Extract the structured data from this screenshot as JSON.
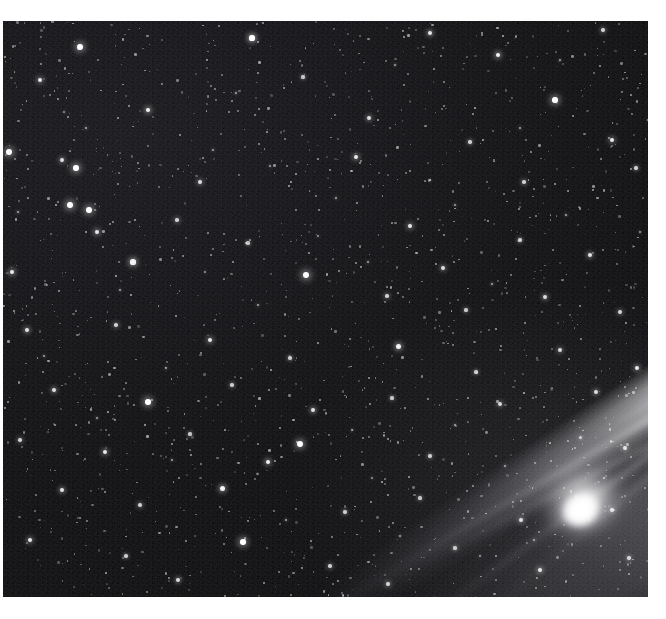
{
  "image": {
    "subject": "comet",
    "title": "Comet with long dust tail over dense star field",
    "medium": "black-and-white astrophotograph",
    "orientation": "landscape",
    "background_color": "#050506",
    "border_color": "#ffffff",
    "star_color": "#ffffff",
    "tail_color": "#b4b4b8",
    "coma_color": "#ffffff"
  },
  "plate": {
    "left": 3,
    "top": 21,
    "width": 645,
    "height": 576
  },
  "comet": {
    "nucleus_x": 578,
    "nucleus_y": 492,
    "coma_width": 88,
    "coma_height": 72,
    "tail_angle_deg": -33,
    "tail_length": 600,
    "tail_direction": "upper-left",
    "filament_count": 4
  },
  "stars": [
    {
      "x": 252,
      "y": 38,
      "r": 2.6,
      "b": 1.0
    },
    {
      "x": 80,
      "y": 47,
      "r": 2.9,
      "b": 1.0
    },
    {
      "x": 430,
      "y": 33,
      "r": 2.1,
      "b": 0.9
    },
    {
      "x": 498,
      "y": 55,
      "r": 2.4,
      "b": 0.95
    },
    {
      "x": 603,
      "y": 30,
      "r": 1.8,
      "b": 0.8
    },
    {
      "x": 555,
      "y": 100,
      "r": 2.7,
      "b": 1.0
    },
    {
      "x": 40,
      "y": 80,
      "r": 2.2,
      "b": 0.9
    },
    {
      "x": 148,
      "y": 110,
      "r": 2.4,
      "b": 0.95
    },
    {
      "x": 303,
      "y": 77,
      "r": 1.6,
      "b": 0.75
    },
    {
      "x": 369,
      "y": 118,
      "r": 2.0,
      "b": 0.85
    },
    {
      "x": 470,
      "y": 142,
      "r": 1.7,
      "b": 0.8
    },
    {
      "x": 612,
      "y": 140,
      "r": 2.2,
      "b": 0.9
    },
    {
      "x": 9,
      "y": 152,
      "r": 3.0,
      "b": 1.0
    },
    {
      "x": 62,
      "y": 160,
      "r": 2.0,
      "b": 0.85
    },
    {
      "x": 76,
      "y": 168,
      "r": 2.8,
      "b": 1.0
    },
    {
      "x": 200,
      "y": 182,
      "r": 1.9,
      "b": 0.85
    },
    {
      "x": 356,
      "y": 157,
      "r": 2.3,
      "b": 0.9
    },
    {
      "x": 524,
      "y": 182,
      "r": 1.8,
      "b": 0.8
    },
    {
      "x": 636,
      "y": 168,
      "r": 1.7,
      "b": 0.8
    },
    {
      "x": 70,
      "y": 205,
      "r": 3.1,
      "b": 1.0
    },
    {
      "x": 89,
      "y": 210,
      "r": 2.9,
      "b": 1.0
    },
    {
      "x": 97,
      "y": 232,
      "r": 2.4,
      "b": 0.9
    },
    {
      "x": 177,
      "y": 220,
      "r": 1.8,
      "b": 0.8
    },
    {
      "x": 248,
      "y": 243,
      "r": 1.6,
      "b": 0.75
    },
    {
      "x": 410,
      "y": 226,
      "r": 2.2,
      "b": 0.9
    },
    {
      "x": 443,
      "y": 268,
      "r": 1.9,
      "b": 0.85
    },
    {
      "x": 520,
      "y": 240,
      "r": 1.7,
      "b": 0.8
    },
    {
      "x": 590,
      "y": 255,
      "r": 2.1,
      "b": 0.88
    },
    {
      "x": 12,
      "y": 272,
      "r": 2.4,
      "b": 0.92
    },
    {
      "x": 133,
      "y": 262,
      "r": 2.6,
      "b": 0.95
    },
    {
      "x": 306,
      "y": 275,
      "r": 3.2,
      "b": 1.0
    },
    {
      "x": 387,
      "y": 296,
      "r": 1.8,
      "b": 0.8
    },
    {
      "x": 466,
      "y": 310,
      "r": 1.6,
      "b": 0.75
    },
    {
      "x": 545,
      "y": 297,
      "r": 2.0,
      "b": 0.85
    },
    {
      "x": 620,
      "y": 312,
      "r": 1.9,
      "b": 0.82
    },
    {
      "x": 27,
      "y": 330,
      "r": 2.1,
      "b": 0.88
    },
    {
      "x": 116,
      "y": 325,
      "r": 1.8,
      "b": 0.8
    },
    {
      "x": 210,
      "y": 340,
      "r": 2.3,
      "b": 0.9
    },
    {
      "x": 290,
      "y": 358,
      "r": 1.7,
      "b": 0.78
    },
    {
      "x": 398,
      "y": 346,
      "r": 2.5,
      "b": 0.95
    },
    {
      "x": 476,
      "y": 372,
      "r": 1.6,
      "b": 0.75
    },
    {
      "x": 560,
      "y": 350,
      "r": 1.9,
      "b": 0.83
    },
    {
      "x": 637,
      "y": 368,
      "r": 2.2,
      "b": 0.9
    },
    {
      "x": 54,
      "y": 390,
      "r": 2.0,
      "b": 0.86
    },
    {
      "x": 148,
      "y": 402,
      "r": 2.8,
      "b": 1.0
    },
    {
      "x": 232,
      "y": 385,
      "r": 1.7,
      "b": 0.78
    },
    {
      "x": 313,
      "y": 410,
      "r": 2.1,
      "b": 0.88
    },
    {
      "x": 392,
      "y": 398,
      "r": 1.6,
      "b": 0.75
    },
    {
      "x": 500,
      "y": 404,
      "r": 1.9,
      "b": 0.83
    },
    {
      "x": 596,
      "y": 392,
      "r": 2.0,
      "b": 0.85
    },
    {
      "x": 20,
      "y": 440,
      "r": 1.8,
      "b": 0.8
    },
    {
      "x": 105,
      "y": 452,
      "r": 2.2,
      "b": 0.9
    },
    {
      "x": 190,
      "y": 434,
      "r": 1.6,
      "b": 0.75
    },
    {
      "x": 268,
      "y": 462,
      "r": 2.4,
      "b": 0.93
    },
    {
      "x": 300,
      "y": 444,
      "r": 3.0,
      "b": 1.0
    },
    {
      "x": 430,
      "y": 456,
      "r": 1.7,
      "b": 0.78
    },
    {
      "x": 625,
      "y": 448,
      "r": 2.0,
      "b": 0.85
    },
    {
      "x": 62,
      "y": 490,
      "r": 2.1,
      "b": 0.88
    },
    {
      "x": 140,
      "y": 505,
      "r": 1.8,
      "b": 0.8
    },
    {
      "x": 222,
      "y": 488,
      "r": 2.5,
      "b": 0.95
    },
    {
      "x": 345,
      "y": 512,
      "r": 1.7,
      "b": 0.78
    },
    {
      "x": 420,
      "y": 498,
      "r": 1.6,
      "b": 0.75
    },
    {
      "x": 521,
      "y": 520,
      "r": 2.0,
      "b": 0.85
    },
    {
      "x": 612,
      "y": 510,
      "r": 1.9,
      "b": 0.83
    },
    {
      "x": 30,
      "y": 540,
      "r": 2.3,
      "b": 0.9
    },
    {
      "x": 126,
      "y": 556,
      "r": 1.7,
      "b": 0.78
    },
    {
      "x": 243,
      "y": 542,
      "r": 2.8,
      "b": 1.0
    },
    {
      "x": 330,
      "y": 566,
      "r": 1.8,
      "b": 0.8
    },
    {
      "x": 455,
      "y": 548,
      "r": 1.6,
      "b": 0.75
    },
    {
      "x": 540,
      "y": 570,
      "r": 2.1,
      "b": 0.88
    },
    {
      "x": 629,
      "y": 558,
      "r": 1.7,
      "b": 0.78
    },
    {
      "x": 178,
      "y": 580,
      "r": 2.0,
      "b": 0.85
    },
    {
      "x": 388,
      "y": 584,
      "r": 1.9,
      "b": 0.83
    },
    {
      "x": 86,
      "y": 128,
      "r": 1.4,
      "b": 0.65
    },
    {
      "x": 213,
      "y": 150,
      "r": 1.3,
      "b": 0.6
    },
    {
      "x": 336,
      "y": 198,
      "r": 1.4,
      "b": 0.62
    },
    {
      "x": 455,
      "y": 205,
      "r": 1.3,
      "b": 0.6
    },
    {
      "x": 566,
      "y": 215,
      "r": 1.4,
      "b": 0.65
    },
    {
      "x": 120,
      "y": 290,
      "r": 1.3,
      "b": 0.6
    },
    {
      "x": 258,
      "y": 305,
      "r": 1.4,
      "b": 0.62
    },
    {
      "x": 368,
      "y": 262,
      "r": 1.3,
      "b": 0.6
    },
    {
      "x": 492,
      "y": 284,
      "r": 1.4,
      "b": 0.64
    },
    {
      "x": 44,
      "y": 356,
      "r": 1.3,
      "b": 0.6
    },
    {
      "x": 166,
      "y": 368,
      "r": 1.4,
      "b": 0.63
    },
    {
      "x": 352,
      "y": 430,
      "r": 1.3,
      "b": 0.6
    },
    {
      "x": 455,
      "y": 425,
      "r": 1.4,
      "b": 0.62
    },
    {
      "x": 97,
      "y": 418,
      "r": 1.3,
      "b": 0.6
    },
    {
      "x": 286,
      "y": 520,
      "r": 1.4,
      "b": 0.64
    },
    {
      "x": 400,
      "y": 536,
      "r": 1.3,
      "b": 0.6
    },
    {
      "x": 505,
      "y": 466,
      "r": 1.4,
      "b": 0.62
    },
    {
      "x": 580,
      "y": 437,
      "r": 1.5,
      "b": 0.7
    },
    {
      "x": 604,
      "y": 478,
      "r": 1.4,
      "b": 0.66
    },
    {
      "x": 534,
      "y": 540,
      "r": 1.3,
      "b": 0.6
    },
    {
      "x": 236,
      "y": 93,
      "r": 1.4,
      "b": 0.63
    },
    {
      "x": 395,
      "y": 65,
      "r": 1.3,
      "b": 0.6
    },
    {
      "x": 520,
      "y": 128,
      "r": 1.4,
      "b": 0.62
    },
    {
      "x": 640,
      "y": 232,
      "r": 1.3,
      "b": 0.6
    },
    {
      "x": 18,
      "y": 212,
      "r": 1.4,
      "b": 0.64
    },
    {
      "x": 172,
      "y": 460,
      "r": 1.3,
      "b": 0.6
    },
    {
      "x": 270,
      "y": 166,
      "r": 1.3,
      "b": 0.58
    },
    {
      "x": 318,
      "y": 236,
      "r": 1.2,
      "b": 0.55
    },
    {
      "x": 430,
      "y": 180,
      "r": 1.2,
      "b": 0.55
    },
    {
      "x": 560,
      "y": 60,
      "r": 1.3,
      "b": 0.6
    },
    {
      "x": 64,
      "y": 112,
      "r": 1.2,
      "b": 0.55
    },
    {
      "x": 205,
      "y": 272,
      "r": 1.2,
      "b": 0.55
    },
    {
      "x": 372,
      "y": 478,
      "r": 1.2,
      "b": 0.55
    },
    {
      "x": 480,
      "y": 556,
      "r": 1.2,
      "b": 0.55
    },
    {
      "x": 648,
      "y": 120,
      "r": 1.2,
      "b": 0.55
    }
  ]
}
